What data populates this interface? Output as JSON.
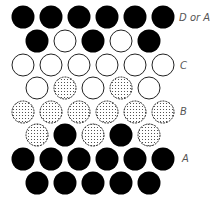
{
  "diagram": {
    "title": "",
    "colors": {
      "black": "#000000",
      "white_fill": "#ffffff",
      "outline": "#222222",
      "dot": "#333333"
    },
    "layout": {
      "radius": 11.5,
      "spacing_x": 28,
      "row_y": [
        17,
        41,
        65,
        88,
        112,
        135,
        159,
        183
      ],
      "long_row_start_x": 23,
      "short_row_start_x": 37
    },
    "rows": [
      {
        "type": "long",
        "cells": [
          "black",
          "black",
          "black",
          "black",
          "black",
          "black"
        ]
      },
      {
        "type": "short",
        "cells": [
          "black",
          "white",
          "black",
          "white",
          "black"
        ]
      },
      {
        "type": "long",
        "cells": [
          "white",
          "white",
          "white",
          "white",
          "white",
          "white"
        ]
      },
      {
        "type": "short",
        "cells": [
          "white",
          "dotted",
          "white",
          "dotted",
          "white"
        ]
      },
      {
        "type": "long",
        "cells": [
          "dotted",
          "dotted",
          "dotted",
          "dotted",
          "dotted",
          "dotted"
        ]
      },
      {
        "type": "short",
        "cells": [
          "dotted",
          "black",
          "dotted",
          "black",
          "dotted"
        ]
      },
      {
        "type": "long",
        "cells": [
          "black",
          "black",
          "black",
          "black",
          "black",
          "black"
        ]
      },
      {
        "type": "short",
        "cells": [
          "black",
          "black",
          "black",
          "black",
          "black"
        ]
      }
    ],
    "labels": [
      {
        "text": "D or A",
        "x": 179,
        "y": 12
      },
      {
        "text": "C",
        "x": 180,
        "y": 60
      },
      {
        "text": "B",
        "x": 180,
        "y": 106
      },
      {
        "text": "A",
        "x": 182,
        "y": 153
      }
    ]
  }
}
